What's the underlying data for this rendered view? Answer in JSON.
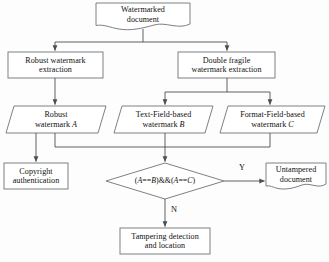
{
  "diagram": {
    "stroke_color": "#6f7276",
    "text_color": "#101010",
    "background": "#fdfdfd",
    "nodes": {
      "watermarked_document": {
        "shape": "document",
        "line1": "Watermarked",
        "line2": "document"
      },
      "robust_extraction": {
        "shape": "process",
        "line1": "Robust watermark",
        "line2": "extraction"
      },
      "double_fragile_extraction": {
        "shape": "process",
        "line1": "Double fragile",
        "line2": "watermark extraction"
      },
      "robust_watermark_a": {
        "shape": "data",
        "line1": "Robust",
        "line2_prefix": "watermark ",
        "line2_var": "A"
      },
      "text_field_watermark_b": {
        "shape": "data",
        "line1": "Text-Field-based",
        "line2_prefix": "watermark ",
        "line2_var": "B"
      },
      "format_field_watermark_c": {
        "shape": "data",
        "line1": "Format-Field-based",
        "line2_prefix": "watermark ",
        "line2_var": "C"
      },
      "copyright_authentication": {
        "shape": "process",
        "line1": "Copyright",
        "line2": "authentication"
      },
      "decision": {
        "shape": "decision",
        "expr_open": "(",
        "expr_a1": "A",
        "expr_eq1": "==",
        "expr_b": "B",
        "expr_mid": ")&&(",
        "expr_a2": "A",
        "expr_eq2": "==",
        "expr_c": "C",
        "expr_close": ")",
        "expr_plain": "(A==B)&&(A==C)"
      },
      "untampered_document": {
        "shape": "document",
        "line1": "Untampered",
        "line2": "document"
      },
      "tampering_detection": {
        "shape": "process",
        "line1": "Tampering  detection",
        "line2": "and location"
      }
    },
    "edge_labels": {
      "yes": "Y",
      "no": "N"
    }
  }
}
